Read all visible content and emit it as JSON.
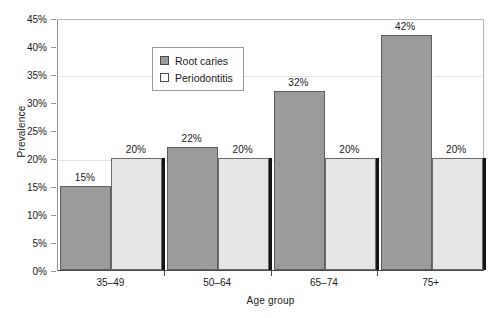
{
  "chart_data": {
    "type": "bar",
    "title": "",
    "xlabel": "Age group",
    "ylabel": "Prevalence",
    "categories": [
      "35–49",
      "50–64",
      "65–74",
      "75+"
    ],
    "series": [
      {
        "name": "Root caries",
        "color": "#9b9b9b",
        "values": [
          15,
          22,
          32,
          42
        ],
        "labels": [
          "15%",
          "22%",
          "32%",
          "42%"
        ]
      },
      {
        "name": "Periodontitis",
        "color": "#e6e6e6",
        "values": [
          20,
          20,
          20,
          20
        ],
        "labels": [
          "20%",
          "20%",
          "20%",
          "20%"
        ]
      }
    ],
    "ylim": [
      0,
      45
    ],
    "ytick_values": [
      0,
      5,
      10,
      15,
      20,
      25,
      30,
      35,
      40,
      45
    ],
    "ytick_labels": [
      "0%",
      "5%",
      "10%",
      "15%",
      "20%",
      "25%",
      "30%",
      "35%",
      "40%",
      "45%"
    ],
    "grid": "horizontal-faint",
    "gridline_values": [
      20,
      35
    ],
    "legend_position": "upper-center-left",
    "legend_entries": [
      "Root caries",
      "Periodontitis"
    ]
  }
}
